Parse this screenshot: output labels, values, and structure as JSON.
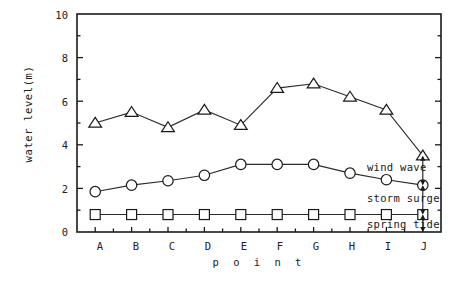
{
  "chart_data": {
    "type": "line",
    "title": "",
    "xlabel": "p o i n t",
    "ylabel": "water level(m)",
    "categories": [
      "A",
      "B",
      "C",
      "D",
      "E",
      "F",
      "G",
      "H",
      "I",
      "J"
    ],
    "ylim": [
      0,
      10
    ],
    "ytick_labels": [
      "0",
      "2",
      "4",
      "6",
      "8",
      "10"
    ],
    "ytick_values": [
      0,
      2,
      4,
      6,
      8,
      10
    ],
    "grid": false,
    "legend_position": "none",
    "series": [
      {
        "name": "wind wave level",
        "marker": "triangle",
        "values": [
          5.0,
          5.5,
          4.8,
          5.6,
          4.9,
          6.6,
          6.8,
          6.2,
          5.6,
          3.5
        ]
      },
      {
        "name": "storm surge level",
        "marker": "circle",
        "values": [
          1.85,
          2.15,
          2.35,
          2.6,
          3.1,
          3.1,
          3.1,
          2.7,
          2.4,
          2.15
        ]
      },
      {
        "name": "spring tide level",
        "marker": "square",
        "values": [
          0.8,
          0.8,
          0.8,
          0.8,
          0.8,
          0.8,
          0.8,
          0.8,
          0.8,
          0.8
        ]
      }
    ],
    "annotations": [
      {
        "label": "wind wave",
        "from": 2.15,
        "to": 3.5,
        "at_category": "J"
      },
      {
        "label": "storm surge",
        "from": 0.8,
        "to": 2.15,
        "at_category": "J"
      },
      {
        "label": "spring tide",
        "from": 0.0,
        "to": 0.8,
        "at_category": "J"
      }
    ],
    "colors": {
      "axis": "#1a1a1a",
      "line": "#2b2b2b",
      "marker_fill": "#ffffff",
      "marker_stroke": "#1a1a1a",
      "background": "#ffffff"
    }
  }
}
